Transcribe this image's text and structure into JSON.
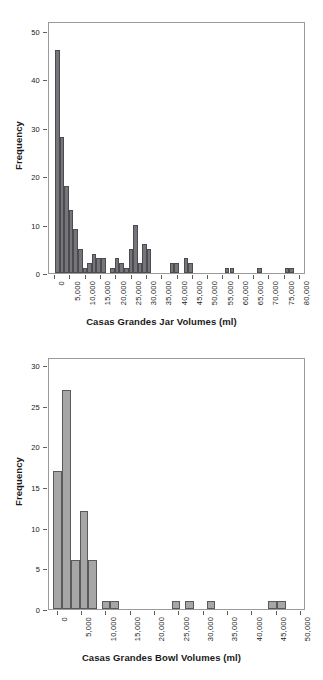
{
  "chart_data": [
    {
      "type": "bar",
      "id": "casas-grandes-jar-volumes",
      "title": "",
      "xlabel": "Casas Grandes Jar Volumes (ml)",
      "ylabel": "Frequency",
      "xlim": [
        -2000,
        82000
      ],
      "ylim": [
        0,
        52
      ],
      "yticks": [
        0,
        10,
        20,
        30,
        40,
        50
      ],
      "ytick_labels": [
        "0",
        "10",
        "20",
        "30",
        "40",
        "50"
      ],
      "xticks": [
        0,
        5000,
        10000,
        15000,
        20000,
        25000,
        30000,
        35000,
        40000,
        45000,
        50000,
        55000,
        60000,
        65000,
        70000,
        75000,
        80000
      ],
      "xtick_labels": [
        "0",
        "5,000",
        "10,000",
        "15,000",
        "20,000",
        "25,000",
        "30,000",
        "35,000",
        "40,000",
        "45,000",
        "50,000",
        "55,000",
        "60,000",
        "65,000",
        "70,000",
        "75,000",
        "80,000"
      ],
      "bin_width": 1500,
      "grid": false,
      "legend": false,
      "bar_color": "#76767a",
      "bar_edge_color": "#4c4c50",
      "bins": [
        {
          "x": 0,
          "value": 46
        },
        {
          "x": 1500,
          "value": 28
        },
        {
          "x": 3000,
          "value": 18
        },
        {
          "x": 4500,
          "value": 13
        },
        {
          "x": 6000,
          "value": 9
        },
        {
          "x": 7500,
          "value": 5
        },
        {
          "x": 9000,
          "value": 1
        },
        {
          "x": 10500,
          "value": 2
        },
        {
          "x": 12000,
          "value": 4
        },
        {
          "x": 13500,
          "value": 3
        },
        {
          "x": 15000,
          "value": 3
        },
        {
          "x": 16500,
          "value": 0
        },
        {
          "x": 18000,
          "value": 1
        },
        {
          "x": 19500,
          "value": 3
        },
        {
          "x": 21000,
          "value": 2
        },
        {
          "x": 22500,
          "value": 1
        },
        {
          "x": 24000,
          "value": 5
        },
        {
          "x": 25500,
          "value": 10
        },
        {
          "x": 27000,
          "value": 2
        },
        {
          "x": 28500,
          "value": 6
        },
        {
          "x": 30000,
          "value": 5
        },
        {
          "x": 31500,
          "value": 0
        },
        {
          "x": 33000,
          "value": 0
        },
        {
          "x": 34500,
          "value": 0
        },
        {
          "x": 36000,
          "value": 0
        },
        {
          "x": 37500,
          "value": 2
        },
        {
          "x": 39000,
          "value": 2
        },
        {
          "x": 40500,
          "value": 0
        },
        {
          "x": 42000,
          "value": 3
        },
        {
          "x": 43500,
          "value": 2
        },
        {
          "x": 45000,
          "value": 0
        },
        {
          "x": 46500,
          "value": 0
        },
        {
          "x": 48000,
          "value": 0
        },
        {
          "x": 55500,
          "value": 1
        },
        {
          "x": 57000,
          "value": 1
        },
        {
          "x": 66000,
          "value": 1
        },
        {
          "x": 75000,
          "value": 1
        },
        {
          "x": 76500,
          "value": 1
        }
      ]
    },
    {
      "type": "bar",
      "id": "casas-grandes-bowl-volumes",
      "title": "",
      "xlabel": "Casas Grandes Bowl Volumes (ml)",
      "ylabel": "Frequency",
      "xlim": [
        -1800,
        51000
      ],
      "ylim": [
        0,
        31
      ],
      "yticks": [
        0,
        5,
        10,
        15,
        20,
        25,
        30
      ],
      "ytick_labels": [
        "0",
        "5",
        "10",
        "15",
        "20",
        "25",
        "30"
      ],
      "xticks": [
        0,
        5000,
        10000,
        15000,
        20000,
        25000,
        30000,
        35000,
        40000,
        45000,
        50000
      ],
      "xtick_labels": [
        "0",
        "5,000",
        "10,000",
        "15,000",
        "20,000",
        "25,000",
        "30,000",
        "35,000",
        "40,000",
        "45,000",
        "50,000"
      ],
      "bin_width": 1800,
      "grid": false,
      "legend": false,
      "bar_color": "#a6a6a6",
      "bar_edge_color": "#5a5a5a",
      "bins": [
        {
          "x": -900,
          "value": 17
        },
        {
          "x": 900,
          "value": 27
        },
        {
          "x": 2700,
          "value": 6
        },
        {
          "x": 4500,
          "value": 12
        },
        {
          "x": 6300,
          "value": 6
        },
        {
          "x": 9000,
          "value": 1
        },
        {
          "x": 10800,
          "value": 1
        },
        {
          "x": 23400,
          "value": 1
        },
        {
          "x": 26100,
          "value": 1
        },
        {
          "x": 30600,
          "value": 1
        },
        {
          "x": 43200,
          "value": 1
        },
        {
          "x": 45000,
          "value": 1
        }
      ]
    }
  ]
}
